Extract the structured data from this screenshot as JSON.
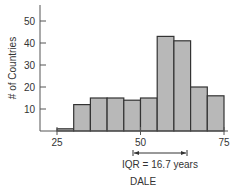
{
  "chart_data": {
    "type": "bar",
    "subtype": "histogram",
    "title": "",
    "xlabel": "DALE",
    "ylabel": "# of Countries",
    "bin_width": 5,
    "bins": [
      {
        "start": 25,
        "end": 30,
        "count": 1
      },
      {
        "start": 30,
        "end": 35,
        "count": 12
      },
      {
        "start": 35,
        "end": 40,
        "count": 15
      },
      {
        "start": 40,
        "end": 45,
        "count": 15
      },
      {
        "start": 45,
        "end": 50,
        "count": 14
      },
      {
        "start": 50,
        "end": 55,
        "count": 15
      },
      {
        "start": 55,
        "end": 60,
        "count": 43
      },
      {
        "start": 60,
        "end": 65,
        "count": 41
      },
      {
        "start": 65,
        "end": 70,
        "count": 20
      },
      {
        "start": 70,
        "end": 75,
        "count": 16
      }
    ],
    "categories": [
      "25-30",
      "30-35",
      "35-40",
      "40-45",
      "45-50",
      "50-55",
      "55-60",
      "60-65",
      "65-70",
      "70-75"
    ],
    "values": [
      1,
      12,
      15,
      15,
      14,
      15,
      43,
      41,
      20,
      16
    ],
    "x_ticks": [
      25,
      50,
      75
    ],
    "y_ticks": [
      10,
      20,
      30,
      40,
      50
    ],
    "xlim": [
      22,
      77
    ],
    "ylim": [
      0,
      55
    ],
    "grid": false,
    "annotations": [
      {
        "text": "IQR = 16.7 years",
        "type": "range-arrow",
        "x_start": 50,
        "x_end": 66.7
      }
    ]
  },
  "labels": {
    "ylabel": "# of Countries",
    "xlabel": "DALE",
    "iqr": "IQR = 16.7 years",
    "x_ticks": [
      "25",
      "50",
      "75"
    ],
    "y_ticks": [
      "10",
      "20",
      "30",
      "40",
      "50"
    ]
  }
}
